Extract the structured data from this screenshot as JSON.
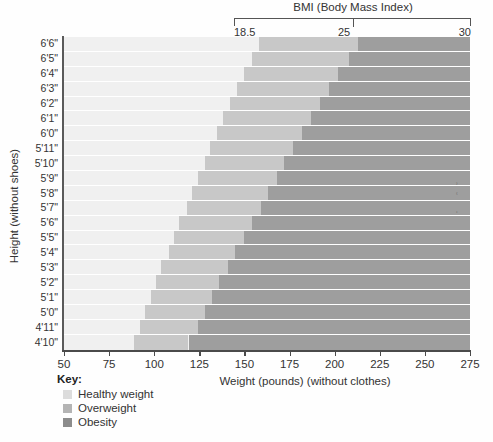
{
  "chart_data": {
    "type": "heatmap",
    "title": "BMI (Body Mass Index)",
    "xlabel": "Weight (pounds) (without clothes)",
    "ylabel": "Height (without shoes)",
    "xlim": [
      50,
      275
    ],
    "ylim": [
      "4'10\"",
      "6'6\""
    ],
    "grid": true,
    "legend_position": "bottom-left",
    "bmi_scale": {
      "label": "BMI (Body Mass Index)",
      "ticks": [
        "18.5",
        "25",
        "30"
      ],
      "values": [
        18.5,
        25,
        30
      ]
    },
    "x_ticks": [
      "50",
      "75",
      "100",
      "125",
      "150",
      "175",
      "200",
      "225",
      "250",
      "275"
    ],
    "x_tick_values": [
      50,
      75,
      100,
      125,
      150,
      175,
      200,
      225,
      250,
      275
    ],
    "y_ticks": [
      "6'6\"",
      "6'5\"",
      "6'4\"",
      "6'3\"",
      "6'2\"",
      "6'1\"",
      "6'0\"",
      "5'11\"",
      "5'10\"",
      "5'9\"",
      "5'8\"",
      "5'7\"",
      "5'6\"",
      "5'5\"",
      "5'4\"",
      "5'3\"",
      "5'2\"",
      "5'1\"",
      "5'0\"",
      "4'11\"",
      "4'10\""
    ],
    "categories": [
      "Healthy weight",
      "Overweight",
      "Obesity"
    ],
    "band_colors": [
      "#f0f0f0",
      "#c8c8c8",
      "#9e9e9e"
    ],
    "rows": [
      {
        "height": "6'6\"",
        "height_in": 78,
        "healthy_max_lb": 158,
        "overweight_max_lb": 213,
        "obesity_min_lb": 256
      },
      {
        "height": "6'5\"",
        "height_in": 77,
        "healthy_max_lb": 154,
        "overweight_max_lb": 208,
        "obesity_min_lb": 249
      },
      {
        "height": "6'4\"",
        "height_in": 76,
        "healthy_max_lb": 150,
        "overweight_max_lb": 202,
        "obesity_min_lb": 243
      },
      {
        "height": "6'3\"",
        "height_in": 75,
        "healthy_max_lb": 146,
        "overweight_max_lb": 197,
        "obesity_min_lb": 237
      },
      {
        "height": "6'2\"",
        "height_in": 74,
        "healthy_max_lb": 142,
        "overweight_max_lb": 192,
        "obesity_min_lb": 230
      },
      {
        "height": "6'1\"",
        "height_in": 73,
        "healthy_max_lb": 138,
        "overweight_max_lb": 187,
        "obesity_min_lb": 224
      },
      {
        "height": "6'0\"",
        "height_in": 72,
        "healthy_max_lb": 135,
        "overweight_max_lb": 182,
        "obesity_min_lb": 218
      },
      {
        "height": "5'11\"",
        "height_in": 71,
        "healthy_max_lb": 131,
        "overweight_max_lb": 177,
        "obesity_min_lb": 212
      },
      {
        "height": "5'10\"",
        "height_in": 70,
        "healthy_max_lb": 128,
        "overweight_max_lb": 172,
        "obesity_min_lb": 207
      },
      {
        "height": "5'9\"",
        "height_in": 69,
        "healthy_max_lb": 124,
        "overweight_max_lb": 168,
        "obesity_min_lb": 201
      },
      {
        "height": "5'8\"",
        "height_in": 68,
        "healthy_max_lb": 121,
        "overweight_max_lb": 163,
        "obesity_min_lb": 196
      },
      {
        "height": "5'7\"",
        "height_in": 67,
        "healthy_max_lb": 118,
        "overweight_max_lb": 159,
        "obesity_min_lb": 191
      },
      {
        "height": "5'6\"",
        "height_in": 66,
        "healthy_max_lb": 114,
        "overweight_max_lb": 154,
        "obesity_min_lb": 185
      },
      {
        "height": "5'5\"",
        "height_in": 65,
        "healthy_max_lb": 111,
        "overweight_max_lb": 150,
        "obesity_min_lb": 180
      },
      {
        "height": "5'4\"",
        "height_in": 64,
        "healthy_max_lb": 108,
        "overweight_max_lb": 145,
        "obesity_min_lb": 174
      },
      {
        "height": "5'3\"",
        "height_in": 63,
        "healthy_max_lb": 104,
        "overweight_max_lb": 141,
        "obesity_min_lb": 169
      },
      {
        "height": "5'2\"",
        "height_in": 62,
        "healthy_max_lb": 101,
        "overweight_max_lb": 136,
        "obesity_min_lb": 164
      },
      {
        "height": "5'1\"",
        "height_in": 61,
        "healthy_max_lb": 98,
        "overweight_max_lb": 132,
        "obesity_min_lb": 159
      },
      {
        "height": "5'0\"",
        "height_in": 60,
        "healthy_max_lb": 95,
        "overweight_max_lb": 128,
        "obesity_min_lb": 153
      },
      {
        "height": "4'11\"",
        "height_in": 59,
        "healthy_max_lb": 92,
        "overweight_max_lb": 124,
        "obesity_min_lb": 148
      },
      {
        "height": "4'10\"",
        "height_in": 58,
        "healthy_max_lb": 89,
        "overweight_max_lb": 119,
        "obesity_min_lb": 143
      }
    ]
  },
  "legend": {
    "title": "Key:",
    "items": [
      {
        "label": "Healthy weight",
        "color": "#dcdcdc"
      },
      {
        "label": "Overweight",
        "color": "#b4b4b4"
      },
      {
        "label": "Obesity",
        "color": "#8c8c8c"
      }
    ]
  },
  "artifact": {
    "mark": "ʿ"
  }
}
